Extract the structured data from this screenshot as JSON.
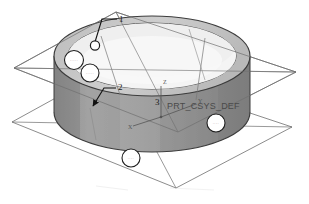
{
  "figure": {
    "kind": "cad-3d-view",
    "software_style": "parametric-cad-shaded-wireframe",
    "background_color": "#ffffff"
  },
  "colors": {
    "background": "#ffffff",
    "outer_wall": "#9a9a9a",
    "outer_wall_dark": "#828282",
    "top_rim": "#c8c8c8",
    "inner_floor": "#efefef",
    "inner_wall": "#b4b4b4",
    "datum_line": "#6f6f6f",
    "outline": "#3c3c3c",
    "leader_line": "#111111",
    "tag_fill": "#ffffff",
    "tag_stroke": "#1f1f1f",
    "csys_text": "#4a4a4a"
  },
  "callouts": [
    {
      "id": "callout-1",
      "label": "1",
      "x": 120,
      "y": 16,
      "target_x": 95,
      "target_y": 44,
      "marker": "circle"
    },
    {
      "id": "callout-2",
      "label": "2",
      "x": 119,
      "y": 86,
      "target_x": 93,
      "target_y": 108,
      "marker": "arrow"
    },
    {
      "id": "callout-3",
      "label": "3",
      "x": 157,
      "y": 103,
      "target_x": 160,
      "target_y": 112,
      "marker": "none"
    }
  ],
  "csys": {
    "label": "PRT_CSYS_DEF",
    "label_x": 167,
    "label_y": 109,
    "origin_x": 161,
    "origin_y": 117,
    "axes": [
      {
        "name": "x-axis",
        "label": "X"
      },
      {
        "name": "y-axis",
        "label": "Y"
      },
      {
        "name": "z-axis",
        "label": "Z"
      }
    ]
  },
  "tags": [
    {
      "id": "tag-a",
      "cx": 74,
      "cy": 60,
      "r": 9.5,
      "text": "·····"
    },
    {
      "id": "tag-b",
      "cx": 90,
      "cy": 73,
      "r": 9.0,
      "text": "·····"
    },
    {
      "id": "tag-c",
      "cx": 216,
      "cy": 123,
      "r": 9.0,
      "text": "····"
    },
    {
      "id": "tag-d",
      "cx": 131,
      "cy": 158,
      "r": 9.0,
      "text": "····"
    }
  ],
  "geometry": {
    "cylinder": {
      "center_x": 152,
      "top_cy": 56,
      "bottom_cy": 112,
      "outer_rx": 98,
      "outer_ry": 40,
      "inner_rx": 84,
      "inner_ry": 33,
      "wall_height": 56
    },
    "datum_plane_upper": {
      "points": "14,68 116,12 296,72 178,132"
    },
    "datum_plane_lower": {
      "points": "12,122 112,67 292,127 176,188"
    }
  }
}
